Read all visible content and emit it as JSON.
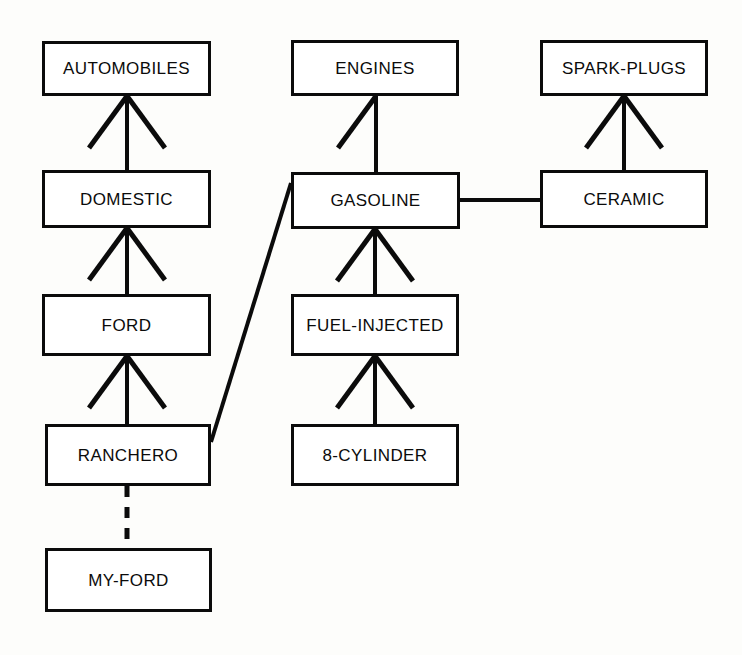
{
  "diagram": {
    "type": "semantic-network",
    "background_color": "#fdfdfb",
    "stroke_color": "#0b0b0b",
    "node_fill_color": "#ffffff",
    "nodes": [
      {
        "id": "automobiles",
        "label": "AUTOMOBILES",
        "x": 42,
        "y": 41,
        "w": 169,
        "h": 55
      },
      {
        "id": "engines",
        "label": "ENGINES",
        "x": 291,
        "y": 40,
        "w": 168,
        "h": 56
      },
      {
        "id": "spark-plugs",
        "label": "SPARK-PLUGS",
        "x": 540,
        "y": 40,
        "w": 168,
        "h": 56
      },
      {
        "id": "domestic",
        "label": "DOMESTIC",
        "x": 42,
        "y": 170,
        "w": 169,
        "h": 58
      },
      {
        "id": "gasoline",
        "label": "GASOLINE",
        "x": 291,
        "y": 172,
        "w": 169,
        "h": 57
      },
      {
        "id": "ceramic",
        "label": "CERAMIC",
        "x": 540,
        "y": 170,
        "w": 168,
        "h": 58
      },
      {
        "id": "ford",
        "label": "FORD",
        "x": 42,
        "y": 294,
        "w": 169,
        "h": 62
      },
      {
        "id": "fuel-injected",
        "label": "FUEL-INJECTED",
        "x": 291,
        "y": 294,
        "w": 168,
        "h": 62
      },
      {
        "id": "ranchero",
        "label": "RANCHERO",
        "x": 45,
        "y": 424,
        "w": 166,
        "h": 62
      },
      {
        "id": "8-cylinder",
        "label": "8-CYLINDER",
        "x": 291,
        "y": 424,
        "w": 168,
        "h": 62
      },
      {
        "id": "my-ford",
        "label": "MY-FORD",
        "x": 45,
        "y": 548,
        "w": 167,
        "h": 64
      }
    ],
    "edges": [
      {
        "id": "domestic-isa-automobiles",
        "from": "domestic",
        "to": "automobiles",
        "style": "arrow",
        "arrow_x": 127,
        "arrow_y": 96,
        "stem_y": 170
      },
      {
        "id": "ford-isa-domestic",
        "from": "ford",
        "to": "domestic",
        "style": "arrow",
        "arrow_x": 127,
        "arrow_y": 228,
        "stem_y": 294
      },
      {
        "id": "ranchero-isa-ford",
        "from": "ranchero",
        "to": "ford",
        "style": "arrow",
        "arrow_x": 127,
        "arrow_y": 356,
        "stem_y": 424
      },
      {
        "id": "gasoline-isa-engines",
        "from": "gasoline",
        "to": "engines",
        "style": "arrow-left-barb",
        "arrow_x": 376,
        "arrow_y": 96,
        "stem_y": 172
      },
      {
        "id": "fuel-injected-isa-gasoline",
        "from": "fuel-injected",
        "to": "gasoline",
        "style": "arrow",
        "arrow_x": 375,
        "arrow_y": 229,
        "stem_y": 294
      },
      {
        "id": "8-cylinder-isa-fuel-injected",
        "from": "8-cylinder",
        "to": "fuel-injected",
        "style": "arrow",
        "arrow_x": 375,
        "arrow_y": 356,
        "stem_y": 424
      },
      {
        "id": "ceramic-isa-spark-plugs",
        "from": "ceramic",
        "to": "spark-plugs",
        "style": "arrow",
        "arrow_x": 624,
        "arrow_y": 96,
        "stem_y": 170
      },
      {
        "id": "gasoline-ceramic-link",
        "from": "gasoline",
        "to": "ceramic",
        "style": "plain-line",
        "x1": 460,
        "y1": 200,
        "x2": 540,
        "y2": 200
      },
      {
        "id": "ranchero-has-gasoline",
        "from": "ranchero",
        "to": "gasoline",
        "style": "plain-diagonal",
        "x1": 211,
        "y1": 442,
        "x2": 291,
        "y2": 183
      },
      {
        "id": "my-ford-instance-of-ranchero",
        "from": "my-ford",
        "to": "ranchero",
        "style": "dashed-line",
        "x1": 127,
        "y1": 486,
        "x2": 127,
        "y2": 548
      }
    ]
  }
}
